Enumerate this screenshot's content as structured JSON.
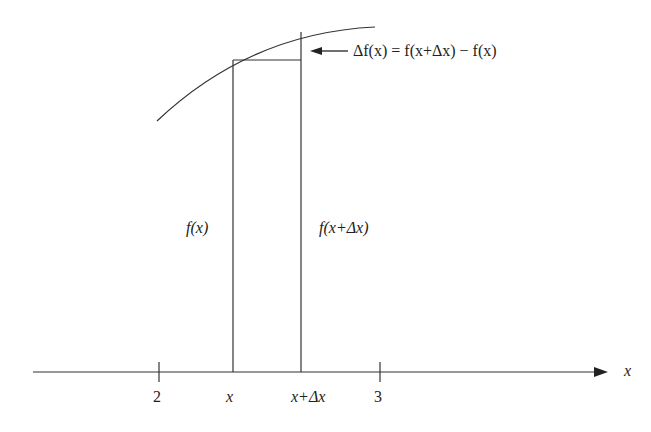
{
  "diagram": {
    "annotation": "Δf(x) = f(x+Δx) − f(x)",
    "left_height_label": "f(x)",
    "right_height_label": "f(x+Δx)",
    "axis_label": "x",
    "ticks": [
      {
        "label": "2"
      },
      {
        "label": "3"
      }
    ],
    "x_marks": [
      {
        "label": "x"
      },
      {
        "label": "x+Δx"
      }
    ],
    "colors": {
      "stroke": "#333333",
      "text": "#222222"
    }
  }
}
